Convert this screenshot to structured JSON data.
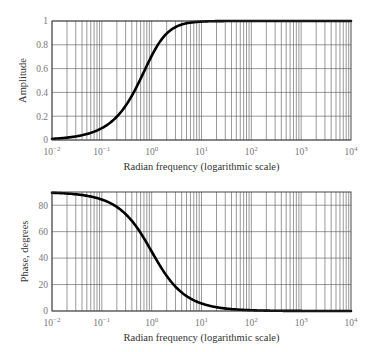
{
  "chart_data": [
    {
      "type": "line",
      "title": "",
      "xlabel": "Radian frequency (logarithmic scale)",
      "ylabel": "Amplitude",
      "xscale": "log",
      "xlim": [
        0.01,
        10000
      ],
      "ylim": [
        0,
        1
      ],
      "xticks": [
        "10^-2",
        "10^-1",
        "10^0",
        "10^1",
        "10^2",
        "10^3",
        "10^4"
      ],
      "yticks": [
        "0",
        "0.2",
        "0.4",
        "0.6",
        "0.8",
        "1"
      ],
      "grid": true,
      "legend": null,
      "series": [
        {
          "name": "Amplitude",
          "x": [
            0.01,
            0.03,
            0.1,
            0.2,
            0.3,
            0.5,
            1,
            2,
            3,
            5,
            10,
            100,
            1000,
            10000
          ],
          "y": [
            0.01,
            0.03,
            0.1,
            0.196,
            0.287,
            0.447,
            0.707,
            0.894,
            0.949,
            0.981,
            0.995,
            1.0,
            1.0,
            1.0
          ]
        }
      ]
    },
    {
      "type": "line",
      "title": "",
      "xlabel": "Radian frequency (logarithmic scale)",
      "ylabel": "Phase, degrees",
      "xscale": "log",
      "xlim": [
        0.01,
        10000
      ],
      "ylim": [
        0,
        90
      ],
      "xticks": [
        "10^-2",
        "10^-1",
        "10^0",
        "10^1",
        "10^2",
        "10^3",
        "10^4"
      ],
      "yticks": [
        "0",
        "20",
        "40",
        "60",
        "80"
      ],
      "grid": true,
      "legend": null,
      "series": [
        {
          "name": "Phase",
          "x": [
            0.01,
            0.03,
            0.1,
            0.2,
            0.3,
            0.5,
            1,
            2,
            3,
            5,
            10,
            30,
            100,
            1000,
            10000
          ],
          "y": [
            89.4,
            88.3,
            84.3,
            78.7,
            73.3,
            63.4,
            45.0,
            26.6,
            18.4,
            11.3,
            5.7,
            1.9,
            0.6,
            0.1,
            0.0
          ]
        }
      ]
    }
  ],
  "labels": {
    "top": {
      "ylabel": "Amplitude",
      "xlabel": "Radian frequency (logarithmic scale)",
      "yticks": [
        "0",
        "0.2",
        "0.4",
        "0.6",
        "0.8",
        "1"
      ]
    },
    "bottom": {
      "ylabel": "Phase, degrees",
      "xlabel": "Radian frequency (logarithmic scale)",
      "yticks": [
        "0",
        "20",
        "40",
        "60",
        "80"
      ]
    },
    "xtick_mantissa": "10",
    "xtick_exponents": [
      "−2",
      "−1",
      "0",
      "1",
      "2",
      "3",
      "4"
    ]
  }
}
